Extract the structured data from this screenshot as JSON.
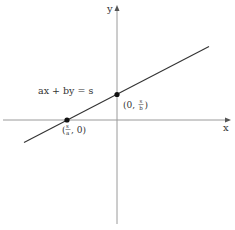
{
  "diagram": {
    "type": "line-intercepts",
    "axes": {
      "x_label": "x",
      "y_label": "y"
    },
    "equation": "ax + by = s",
    "points": [
      {
        "name": "y-intercept",
        "open": "(0, ",
        "num": "s",
        "den": "b",
        "close": ")"
      },
      {
        "name": "x-intercept",
        "open": "(",
        "num": "s",
        "den": "a",
        "close": ", 0)"
      }
    ],
    "colors": {
      "axis": "#999999",
      "line": "#333333",
      "point": "#111111",
      "text": "#333333"
    }
  }
}
